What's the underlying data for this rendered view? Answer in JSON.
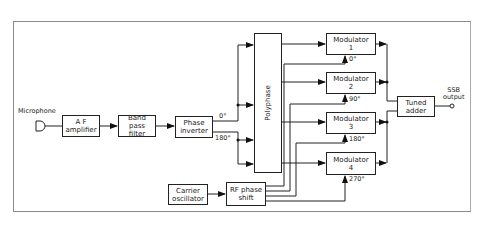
{
  "caption_partial": "...SSB generator block diagram (polyphase method)",
  "blocks": {
    "microphone": "Microphone",
    "af_amplifier": "A F\namplifier",
    "band_pass_filter": "Band pass\nfilter",
    "phase_inverter": "Phase\ninverter",
    "polyphase": "Polyphase",
    "modulator_1": "Modulator\n1",
    "modulator_2": "Modulator\n2",
    "modulator_3": "Modulator\n3",
    "modulator_4": "Modulator\n4",
    "tuned_adder": "Tuned\nadder",
    "carrier_oscillator": "Carrier\noscillator",
    "rf_phase_shift": "RF phase\nshift",
    "ssb_output": "SSB\noutput"
  },
  "labels": {
    "inverter_out_0": "0°",
    "inverter_out_180": "180°",
    "mod1_phase": "0°",
    "mod2_phase": "90°",
    "mod3_phase": "180°",
    "mod4_phase": "270°"
  }
}
